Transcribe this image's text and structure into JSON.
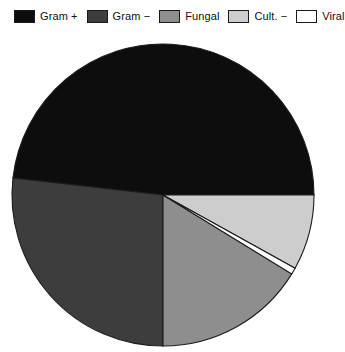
{
  "chart_data": {
    "type": "pie",
    "title": "",
    "subtitle": "",
    "xlabel": "",
    "ylabel": "",
    "legend_position": "top",
    "grid": false,
    "categories": [
      "Gram +",
      "Gram −",
      "Fungal",
      "Cult. −",
      "Viral"
    ],
    "values": [
      51.8,
      26.8,
      16.3,
      8.1,
      0.7
    ],
    "unit": "percent",
    "slices": [
      {
        "label": "Gram +",
        "value": 51.8,
        "color": "#0d0d0d",
        "start_angle_deg": 186.5,
        "end_angle_deg": 360.0
      },
      {
        "label": "Gram −",
        "value": 26.8,
        "color": "#3d3d3d",
        "start_angle_deg": 90.0,
        "end_angle_deg": 186.5
      },
      {
        "label": "Fungal",
        "value": 16.3,
        "color": "#8e8e8e",
        "start_angle_deg": 31.5,
        "end_angle_deg": 90.0
      },
      {
        "label": "Cult. −",
        "value": 8.1,
        "color": "#cdcdcd",
        "start_angle_deg": 0.0,
        "end_angle_deg": 29.0
      },
      {
        "label": "Viral",
        "value": 0.7,
        "color": "#ffffff",
        "start_angle_deg": 29.0,
        "end_angle_deg": 31.5
      }
    ]
  },
  "legend": {
    "entries": [
      {
        "label": "Gram +",
        "color": "#0d0d0d"
      },
      {
        "label": "Gram −",
        "color": "#3d3d3d"
      },
      {
        "label": "Fungal",
        "color": "#8e8e8e"
      },
      {
        "label": "Cult. −",
        "color": "#cdcdcd"
      },
      {
        "label": "Viral",
        "color": "#ffffff"
      }
    ]
  },
  "geometry": {
    "center_x": 163,
    "center_y": 163,
    "radius": 151
  }
}
